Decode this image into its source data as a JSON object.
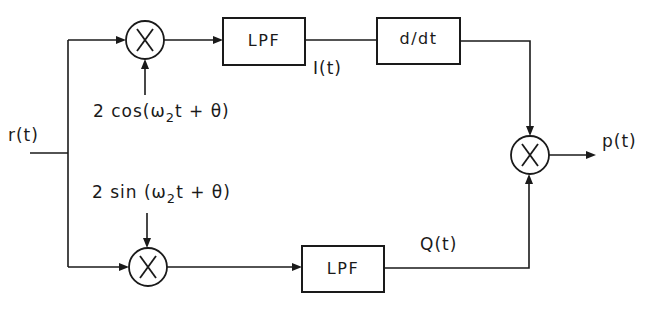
{
  "diagram": {
    "type": "block-diagram",
    "input": {
      "label": "r(t)"
    },
    "output": {
      "label": "p(t)"
    },
    "upper_branch": {
      "multiplier_symbol": "X",
      "reference": {
        "prefix": "2 cos(ω",
        "subscript": "2",
        "suffix": "t + θ)"
      },
      "filter_label": "LPF",
      "signal_label": "I(t)",
      "derivative_label": "d/dt"
    },
    "lower_branch": {
      "multiplier_symbol": "X",
      "reference": {
        "prefix": "2 sin (ω",
        "subscript": "2",
        "suffix": "t + θ)"
      },
      "filter_label": "LPF",
      "signal_label": "Q(t)"
    },
    "output_multiplier_symbol": "X"
  }
}
